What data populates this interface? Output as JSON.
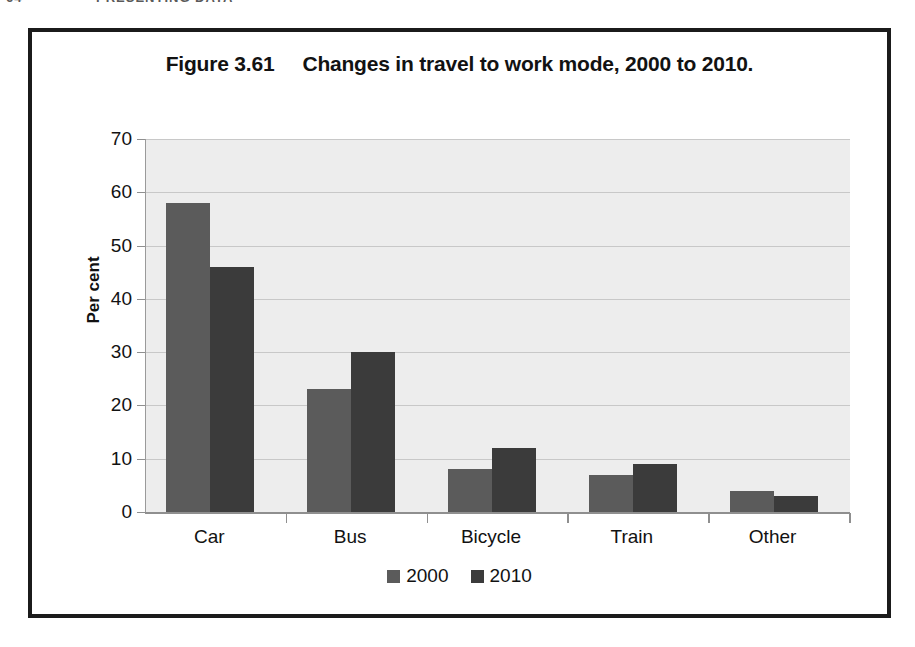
{
  "page_header": {
    "folio": "64",
    "running_title": "PRESENTING DATA"
  },
  "figure": {
    "number_label": "Figure 3.61",
    "caption": "Changes in travel to work mode, 2000 to 2010."
  },
  "colors": {
    "series_2000": "#5b5b5b",
    "series_2010": "#3b3b3b",
    "plot_background": "#ededed",
    "gridline": "#c8c8c8",
    "axis_line": "#8f8f8f",
    "frame_border": "#1b1b1b",
    "text": "#121212"
  },
  "chart_data": {
    "type": "bar",
    "xlabel": "",
    "ylabel": "Per cent",
    "categories": [
      "Car",
      "Bus",
      "Bicycle",
      "Train",
      "Other"
    ],
    "series": [
      {
        "name": "2000",
        "values": [
          58,
          23,
          8,
          7,
          4
        ]
      },
      {
        "name": "2010",
        "values": [
          46,
          30,
          12,
          9,
          3
        ]
      }
    ],
    "ylim": [
      0,
      70
    ],
    "ytick_step": 10,
    "yticks": [
      0,
      10,
      20,
      30,
      40,
      50,
      60,
      70
    ],
    "ytick_labels": [
      "0",
      "10",
      "20",
      "30",
      "40",
      "50",
      "60",
      "70"
    ],
    "grid": true,
    "grid_axis": "y",
    "legend": [
      "2000",
      "2010"
    ],
    "legend_position": "bottom-center"
  }
}
